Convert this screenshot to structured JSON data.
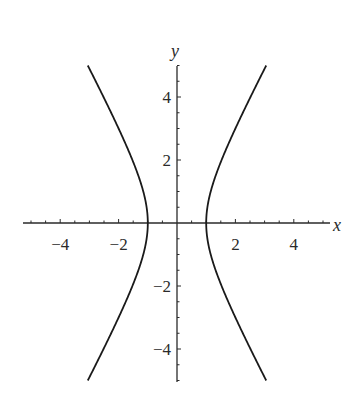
{
  "chart_data": {
    "type": "line",
    "title": "",
    "xlabel": "x",
    "ylabel": "y",
    "xlim": [
      -5.2,
      5.2
    ],
    "ylim": [
      -5,
      5
    ],
    "grid": false,
    "legend": null,
    "equation": "x^2 - y^2/3 = 1",
    "x_ticks": [
      -4,
      -2,
      2,
      4
    ],
    "y_ticks": [
      -4,
      -2,
      2,
      4
    ],
    "x_tick_labels": [
      "−4",
      "−2",
      "2",
      "4"
    ],
    "y_tick_labels": [
      "−4",
      "−2",
      "2",
      "4"
    ],
    "series": [
      {
        "name": "right branch",
        "x": [
          3.06,
          2.5,
          2.0,
          1.53,
          1.15,
          1.0,
          1.15,
          1.53,
          2.0,
          2.5,
          3.06
        ],
        "y": [
          -5,
          -3.97,
          -3.0,
          -2.0,
          -1.0,
          0,
          1.0,
          2.0,
          3.0,
          3.97,
          5
        ]
      },
      {
        "name": "left branch",
        "x": [
          -3.06,
          -2.5,
          -2.0,
          -1.53,
          -1.15,
          -1.0,
          -1.15,
          -1.53,
          -2.0,
          -2.5,
          -3.06
        ],
        "y": [
          -5,
          -3.97,
          -3.0,
          -2.0,
          -1.0,
          0,
          1.0,
          2.0,
          3.0,
          3.97,
          5
        ]
      }
    ],
    "colors": {
      "curve": "#1a1a1a",
      "axis": "#2a2a2a"
    }
  }
}
